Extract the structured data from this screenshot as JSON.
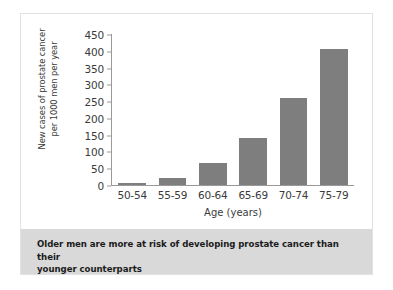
{
  "chart_data": {
    "type": "bar",
    "title": "",
    "categories": [
      "50-54",
      "55-59",
      "60-64",
      "65-69",
      "70-74",
      "75-79"
    ],
    "values": [
      5,
      22,
      65,
      140,
      260,
      405
    ],
    "xlabel": "Age (years)",
    "ylabel_line1": "New cases of prostate cancer",
    "ylabel_line2": "per 1000 men per year",
    "ylim": [
      0,
      450
    ],
    "yticks": [
      0,
      50,
      100,
      150,
      200,
      250,
      300,
      350,
      400,
      450
    ],
    "ytick_labels": [
      "0",
      "50",
      "100",
      "150",
      "200",
      "250",
      "300",
      "350",
      "400",
      "450"
    ],
    "grid": false,
    "legend": "none",
    "bar_color": "#7e7e7e",
    "axis_color": "#9a9a9a"
  },
  "caption": {
    "line1": "Older men are more at risk of developing prostate cancer than their",
    "line2": "younger counterparts",
    "background": "#d9d9d9"
  }
}
